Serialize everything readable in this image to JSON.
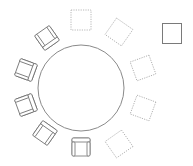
{
  "diagram": {
    "type": "seating-plan",
    "width": 193,
    "height": 166,
    "colors": {
      "background": "#ffffff",
      "table_stroke": "#8a8a8a",
      "chair_stroke": "#6e6e6e",
      "empty_seat_stroke": "#b0b0b0",
      "spare_seat_stroke": "#7a7a7a"
    },
    "table": {
      "shape": "circle",
      "cx": 81,
      "cy": 88,
      "r": 43
    },
    "seats": [
      {
        "id": "seat-1",
        "state": "empty",
        "cx": 81,
        "cy": 20,
        "rotation": 0
      },
      {
        "id": "seat-2",
        "state": "empty",
        "cx": 119,
        "cy": 32,
        "rotation": 35
      },
      {
        "id": "seat-3",
        "state": "empty",
        "cx": 143,
        "cy": 68,
        "rotation": 70
      },
      {
        "id": "seat-4",
        "state": "empty",
        "cx": 143,
        "cy": 108,
        "rotation": 110
      },
      {
        "id": "seat-5",
        "state": "empty",
        "cx": 119,
        "cy": 144,
        "rotation": 145
      },
      {
        "id": "seat-6",
        "state": "chair",
        "cx": 81,
        "cy": 147,
        "rotation": 180
      },
      {
        "id": "seat-7",
        "state": "chair",
        "cx": 45,
        "cy": 133,
        "rotation": 215
      },
      {
        "id": "seat-8",
        "state": "chair",
        "cx": 26,
        "cy": 105,
        "rotation": 250
      },
      {
        "id": "seat-9",
        "state": "chair",
        "cx": 26,
        "cy": 70,
        "rotation": 290
      },
      {
        "id": "seat-10",
        "state": "chair",
        "cx": 47,
        "cy": 38,
        "rotation": 325
      }
    ],
    "spare_seat": {
      "id": "spare-seat",
      "x": 162,
      "y": 23,
      "width": 19,
      "height": 20
    }
  }
}
